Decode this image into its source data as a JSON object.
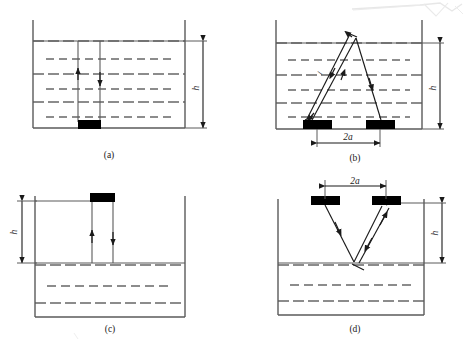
{
  "figure": {
    "kind": "ultrasonic-level-measurement-configurations",
    "panel_count": 4,
    "background_color": "#ffffff",
    "ink_color": "#1a1a1a",
    "wall_color": "#5a5a5a",
    "transducer_color": "#000000",
    "scan_artifact": {
      "present": true,
      "location": "top-right",
      "color": "#d8d8d8"
    }
  },
  "panels": [
    {
      "id": "a",
      "caption": "(a)",
      "description": "Transducer mounted on vessel bottom, beam travels up through liquid to surface",
      "dimension_label": "h",
      "dimension_side": "right",
      "has_2a": false,
      "transducer_position": "bottom",
      "beam_paths": [
        "up-arrow",
        "down-arrow"
      ],
      "medium_fill": "liquid-dashed",
      "dashed_line_count": 6
    },
    {
      "id": "b",
      "caption": "(b)",
      "description": "Two transducers on vessel bottom separated by 2a, V-path beam reflecting off liquid surface",
      "dimension_label": "h",
      "dimension_side": "right",
      "has_2a": true,
      "spacing_label": "2a",
      "spacing_label_position": "below",
      "path_label": "l",
      "transducer_position": "bottom",
      "beam_paths": [
        "v-path-reflect-surface"
      ],
      "medium_fill": "liquid-dashed",
      "dashed_line_count": 6
    },
    {
      "id": "c",
      "caption": "(c)",
      "description": "Transducer mounted at top of vessel above liquid, beam travels down through air to liquid surface",
      "dimension_label": "h",
      "dimension_side": "left",
      "has_2a": false,
      "transducer_position": "top",
      "beam_paths": [
        "down-arrow",
        "up-arrow"
      ],
      "medium_fill": "liquid-dashed-lower",
      "dashed_line_count": 3
    },
    {
      "id": "d",
      "caption": "(d)",
      "description": "Two transducers above liquid separated by 2a, inverted-V path reflecting off liquid surface",
      "dimension_label": "h",
      "dimension_side": "right",
      "has_2a": true,
      "spacing_label": "2a",
      "spacing_label_position": "above",
      "transducer_position": "top",
      "beam_paths": [
        "inverted-v-path-reflect-surface"
      ],
      "medium_fill": "liquid-dashed-lower",
      "dashed_line_count": 3
    }
  ],
  "labels": {
    "height": "h",
    "spacing": "2a",
    "path_length": "l",
    "caption_a": "(a)",
    "caption_b": "(b)",
    "caption_c": "(c)",
    "caption_d": "(d)"
  }
}
